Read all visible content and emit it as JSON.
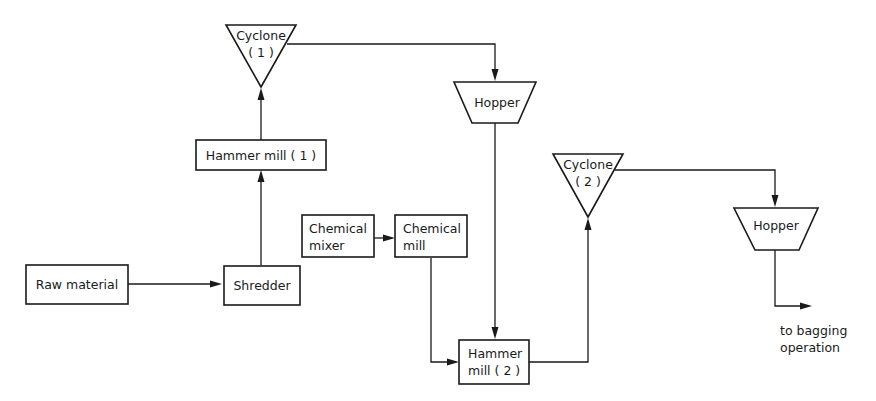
{
  "diagram": {
    "type": "process-flow",
    "line_color": "#1a1a1a",
    "background": "#ffffff",
    "nodes": {
      "raw_material": {
        "shape": "rectangle",
        "line1": "Raw material"
      },
      "shredder": {
        "shape": "rectangle",
        "line1": "Shredder"
      },
      "hammer_mill_1": {
        "shape": "rectangle",
        "line1": "Hammer mill ( 1 )"
      },
      "cyclone_1": {
        "shape": "inverted-triangle",
        "line1": "Cyclone",
        "line2": "( 1 )"
      },
      "hopper_1": {
        "shape": "trapezoid",
        "line1": "Hopper"
      },
      "chemical_mixer": {
        "shape": "rectangle",
        "line1": "Chemical",
        "line2": "mixer"
      },
      "chemical_mill": {
        "shape": "rectangle",
        "line1": "Chemical",
        "line2": "mill"
      },
      "hammer_mill_2": {
        "shape": "rectangle",
        "line1": "Hammer",
        "line2": "mill ( 2 )"
      },
      "cyclone_2": {
        "shape": "inverted-triangle",
        "line1": "Cyclone",
        "line2": "( 2 )"
      },
      "hopper_2": {
        "shape": "trapezoid",
        "line1": "Hopper"
      },
      "output": {
        "shape": "text",
        "line1": "to bagging",
        "line2": "operation"
      }
    },
    "edges": [
      {
        "from": "Raw material",
        "to": "Shredder"
      },
      {
        "from": "Shredder",
        "to": "Hammer mill (1)"
      },
      {
        "from": "Hammer mill (1)",
        "to": "Cyclone (1)"
      },
      {
        "from": "Cyclone (1)",
        "to": "Hopper"
      },
      {
        "from": "Hopper",
        "to": "Hammer mill (2)"
      },
      {
        "from": "Chemical mixer",
        "to": "Chemical mill"
      },
      {
        "from": "Chemical mill",
        "to": "Hammer mill (2)"
      },
      {
        "from": "Hammer mill (2)",
        "to": "Cyclone (2)"
      },
      {
        "from": "Cyclone (2)",
        "to": "Hopper"
      },
      {
        "from": "Hopper",
        "to": "to bagging operation"
      }
    ]
  }
}
